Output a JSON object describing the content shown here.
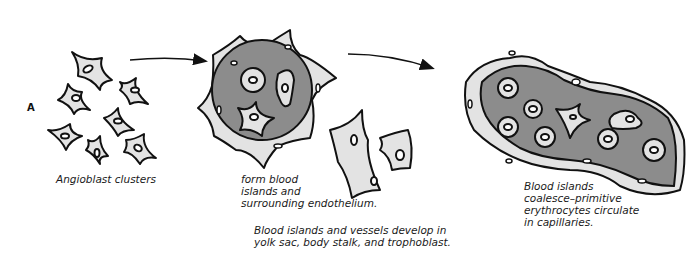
{
  "panel_label": "A",
  "colors": {
    "cell_fill": "#e3e3e3",
    "blood_island_fill": "#8c8c8c",
    "outline": "#111111",
    "background": "#ffffff"
  },
  "stages": [
    {
      "id": "angioblast-clusters",
      "caption": "Angioblast clusters"
    },
    {
      "id": "blood-island-formation",
      "caption": "form blood\nislands and\nsurrounding endothelium."
    },
    {
      "id": "capillary-formation",
      "caption": "Blood islands\ncoalesce–primitive\nerythrocytes circulate\nin capillaries."
    }
  ],
  "bottom_note": "Blood islands and vessels develop in\nyolk sac, body stalk, and trophoblast.",
  "arrows": [
    {
      "from": "angioblast-clusters",
      "to": "blood-island-formation"
    },
    {
      "from": "blood-island-formation",
      "to": "capillary-formation"
    }
  ]
}
